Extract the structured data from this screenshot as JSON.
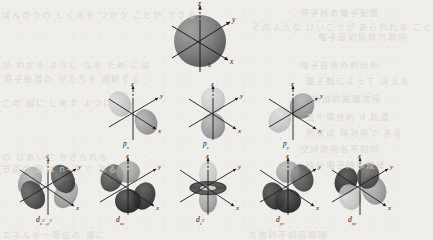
{
  "figure": {
    "background_color": "#efeeea",
    "ink_color": "#1c1c1c",
    "axis_labels": {
      "z": "z",
      "y": "y",
      "x": "x"
    },
    "rows": [
      {
        "row_name": "s-orbital",
        "orbitals": [
          {
            "id": "s",
            "label": "s",
            "label_html": "s",
            "shape": "sphere",
            "cx": 200,
            "cy": 41
          }
        ]
      },
      {
        "row_name": "p-orbitals",
        "orbitals": [
          {
            "id": "px",
            "label": "p_x",
            "label_html": "p<sub>x</sub>",
            "shape": "dumbbell-x",
            "cx": 133,
            "cy": 113
          },
          {
            "id": "pz",
            "label": "p_z",
            "label_html": "p<sub>z</sub>",
            "shape": "dumbbell-z",
            "cx": 213,
            "cy": 113
          },
          {
            "id": "py",
            "label": "p_y",
            "label_html": "p<sub>y</sub>",
            "shape": "dumbbell-y",
            "cx": 293,
            "cy": 113
          }
        ]
      },
      {
        "row_name": "d-orbitals",
        "orbitals": [
          {
            "id": "dx2y2",
            "label": "d_x2-y2",
            "label_html": "d<sub>x<sup>2</sup>–y<sup>2</sup></sub>",
            "shape": "cloverleaf-axial",
            "cx": 48,
            "cy": 187
          },
          {
            "id": "dxz",
            "label": "d_xz",
            "label_html": "d<sub>xz</sub>",
            "shape": "cloverleaf-xz",
            "cx": 128,
            "cy": 187
          },
          {
            "id": "dz2",
            "label": "d_z2",
            "label_html": "d<sub>z<sup>2</sup></sub>",
            "shape": "dumbbell-torus",
            "cx": 208,
            "cy": 187
          },
          {
            "id": "dyz",
            "label": "d_yz",
            "label_html": "d<sub>yz</sub>",
            "shape": "cloverleaf-yz",
            "cx": 288,
            "cy": 187
          },
          {
            "id": "dxy",
            "label": "d_xy",
            "label_html": "d<sub>xy</sub>",
            "shape": "cloverleaf-xy",
            "cx": 360,
            "cy": 187
          }
        ]
      }
    ],
    "background_bleed_text": [
      {
        "text": "はんのうの しくみを つかう ことが できる",
        "x": 2,
        "y": 8
      },
      {
        "text": "原子核の電子配置",
        "x": 300,
        "y": 6
      },
      {
        "text": "そのような けいこうが あらわれる こと",
        "x": 252,
        "y": 20
      },
      {
        "text": "电子云的形状与取向",
        "x": 318,
        "y": 30
      },
      {
        "text": "が わかる ように なる ため には",
        "x": 2,
        "y": 58
      },
      {
        "text": "原子軌道の かたちを 理解する",
        "x": 4,
        "y": 72
      },
      {
        "text": "电子在核外的分布",
        "x": 300,
        "y": 58
      },
      {
        "text": "量子数によって 決まる",
        "x": 306,
        "y": 74
      },
      {
        "text": "轨道的能量次序",
        "x": 312,
        "y": 92
      },
      {
        "text": "この 図に しめす ように",
        "x": 2,
        "y": 96
      },
      {
        "text": "五个简并的 d 轨道",
        "x": 306,
        "y": 110
      },
      {
        "text": "形状は 球対称で ある",
        "x": 306,
        "y": 126
      },
      {
        "text": "空间取向各不相同",
        "x": 300,
        "y": 142
      },
      {
        "text": "の ばあいに かぎられる",
        "x": 2,
        "y": 150
      },
      {
        "text": "节面の 数は n−1 で ある",
        "x": 2,
        "y": 162
      },
      {
        "text": "核外电子排布规律",
        "x": 306,
        "y": 158
      },
      {
        "text": "エネルギー準位の 順に",
        "x": 2,
        "y": 228
      },
      {
        "text": "与泡利不相容原理",
        "x": 248,
        "y": 228
      }
    ]
  }
}
